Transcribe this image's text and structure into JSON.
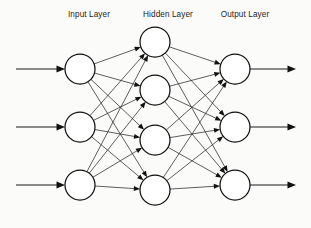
{
  "diagram": {
    "background_color": "#fbfbfa",
    "node_fill_color": "#ffffff",
    "node_stroke_color": "#111111",
    "edge_color": "#2a2a2a",
    "label_color": "#1c1c1c",
    "layers": [
      {
        "id": "input",
        "label": "Input Layer",
        "label_x": 89,
        "label_y": 17,
        "center_x": 80,
        "node_radius": 15,
        "node_count": 3,
        "node_y": [
          69,
          127,
          185
        ]
      },
      {
        "id": "hidden",
        "label": "Hidden Layer",
        "label_x": 168,
        "label_y": 17,
        "center_x": 155,
        "node_radius": 15,
        "node_count": 4,
        "node_y": [
          42,
          90,
          140,
          190
        ]
      },
      {
        "id": "output",
        "label": "Output Layer",
        "label_x": 245,
        "label_y": 17,
        "center_x": 235,
        "node_radius": 15,
        "node_count": 3,
        "node_y": [
          69,
          127,
          185
        ]
      }
    ],
    "connections": [
      {
        "from_layer": "input",
        "to_layer": "hidden",
        "fully_connected": true,
        "edge_count": 12
      },
      {
        "from_layer": "hidden",
        "to_layer": "output",
        "fully_connected": true,
        "edge_count": 12
      }
    ],
    "input_arrows": {
      "count": 3,
      "x_start": 16,
      "x_end": 65,
      "y": [
        69,
        127,
        185
      ]
    },
    "output_arrows": {
      "count": 3,
      "x_start": 250,
      "x_end": 296,
      "y": [
        69,
        127,
        185
      ]
    }
  }
}
